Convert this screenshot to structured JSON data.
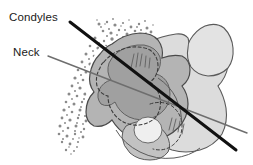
{
  "figure": {
    "type": "anatomical-line-drawing",
    "background_color": "#ffffff",
    "width": 253,
    "height": 165
  },
  "labels": [
    {
      "id": "condyles",
      "text": "Condyles",
      "x": 9,
      "y": 12,
      "leader_name": "condyles-leader-line",
      "leader_style": "thick-black-solid",
      "leader_color": "#111111",
      "leader_width": 3.0,
      "leader_from": [
        70,
        22
      ],
      "leader_to": [
        236,
        150
      ]
    },
    {
      "id": "neck",
      "text": "Neck",
      "x": 13,
      "y": 47,
      "leader_name": "neck-leader-line",
      "leader_style": "thin-gray-solid",
      "leader_color": "#6e6e6e",
      "leader_width": 1.4,
      "leader_from": [
        48,
        56
      ],
      "leader_to": [
        247,
        133
      ]
    }
  ],
  "colors": {
    "outline": "#4a4a4a",
    "stipple": "#8a8a8a",
    "fill_dark": "#a0a0a0",
    "fill_mid": "#b4b4b4",
    "fill_light": "#c9c9c9",
    "fill_pale": "#dcdcdc",
    "white_rim": "#ffffff",
    "dashed_contour": "#3a3a3a",
    "label_text": "#1a1a1a",
    "condyles_axis": "#111111",
    "neck_axis": "#6e6e6e"
  },
  "structures": [
    {
      "name": "stipple-field",
      "description": "Dotted cancellous bone texture field on the left",
      "fill": "#8a8a8a",
      "dot_count": 300
    },
    {
      "name": "ramus-body-outline",
      "description": "Large pale mandibular ramus silhouette at right",
      "fill": "#dcdcdc"
    },
    {
      "name": "coronoid-process",
      "description": "Pale leaf-shaped process at upper right",
      "fill": "#e2e2e2"
    },
    {
      "name": "condyle-head-mass",
      "description": "Mid-gray condylar head mass at center",
      "fill": "#b4b4b4"
    },
    {
      "name": "condyle-dark-core",
      "description": "Darker gray inner condyle core",
      "fill": "#a0a0a0"
    },
    {
      "name": "white-cortical-rim",
      "description": "White rim separating stipple field from condyle head",
      "fill": "#ffffff"
    },
    {
      "name": "dashed-inner-contour",
      "description": "Dashed outline tracing hidden inner condyle border",
      "stroke": "#3a3a3a",
      "dash": "3,2.5"
    },
    {
      "name": "sigmoid-notch-circle",
      "description": "Small pale circular structure at lower center",
      "fill": "#eeeeee"
    }
  ]
}
